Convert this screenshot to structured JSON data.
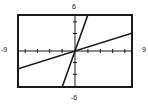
{
  "chart_data": {
    "type": "line",
    "title": "",
    "xlabel": "",
    "ylabel": "",
    "xlim": [
      -9,
      9
    ],
    "ylim": [
      -6,
      6
    ],
    "grid": false,
    "legend": "none",
    "axis_tick_spacing": {
      "x": 1,
      "y": 1
    },
    "tick_labels": {
      "x_min": "-9",
      "x_max": "9",
      "y_min": "-6",
      "y_max": "6"
    },
    "series": [
      {
        "name": "shallow line",
        "type": "line",
        "slope": 0.3333,
        "intercept": 0,
        "x": [
          -9,
          9
        ],
        "y": [
          -3,
          3
        ]
      },
      {
        "name": "steep line",
        "type": "line",
        "slope": 3,
        "intercept": 0,
        "x": [
          -2,
          2
        ],
        "y": [
          -6,
          6
        ]
      }
    ],
    "annotations": []
  },
  "graph": {
    "window_top_label": "6",
    "window_bottom_label": "-6",
    "window_left_label": "-9",
    "window_right_label": "9",
    "frame_color": "#1a1a1a",
    "axis_color": "#1a1a1a",
    "curve_color": "#1a1a1a",
    "background_color": "#ffffff"
  }
}
